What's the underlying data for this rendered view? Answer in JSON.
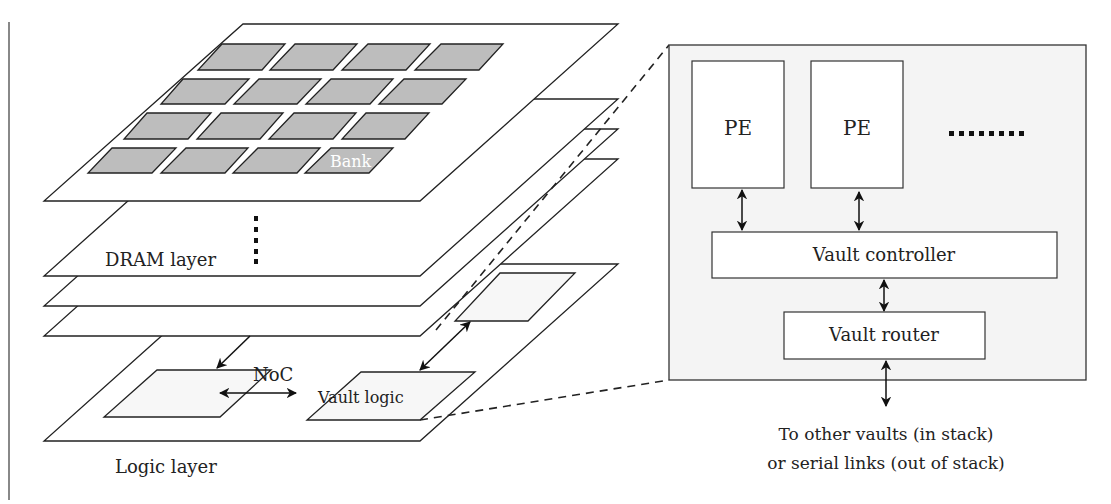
{
  "header": {
    "title_fragment": "3D-STACKING WITH DRAMS"
  },
  "stack": {
    "bank_label": "Bank",
    "dram_layer_label": "DRAM layer",
    "logic_layer_label": "Logic layer",
    "noc_label": "NoC",
    "vault_logic_label": "Vault logic",
    "bank_grid": {
      "rows": 4,
      "cols": 4
    },
    "dram_layers_shown": 4
  },
  "vault_detail": {
    "pe_labels": [
      "PE",
      "PE"
    ],
    "ellipsis": "........",
    "vault_controller_label": "Vault controller",
    "vault_router_label": "Vault router",
    "caption_line1": "To other vaults (in stack)",
    "caption_line2": "or serial links (out of stack)"
  },
  "colors": {
    "bank_fill": "#bdbdbd",
    "line": "#222222",
    "outer_box_fill": "#f4f4f4"
  }
}
